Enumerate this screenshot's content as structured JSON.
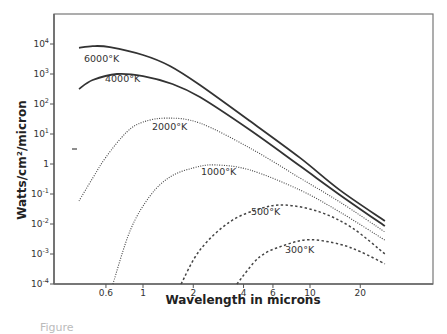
{
  "chart_data": {
    "type": "line",
    "title": "",
    "xlabel": "Wavelength in microns",
    "ylabel": "Watts/cm²/micron",
    "xscale": "log",
    "yscale": "log",
    "xlim": [
      0.3,
      60
    ],
    "ylim": [
      0.0001,
      100000
    ],
    "grid": false,
    "legend": "none (inline curve labels)",
    "x_ticks": [
      {
        "value": 0.6,
        "label": "0.6"
      },
      {
        "value": 1,
        "label": "1"
      },
      {
        "value": 2,
        "label": "2"
      },
      {
        "value": 4,
        "label": "4"
      },
      {
        "value": 6,
        "label": "6"
      },
      {
        "value": 10,
        "label": "10"
      },
      {
        "value": 20,
        "label": "20"
      }
    ],
    "y_ticks": [
      {
        "value": 10000,
        "base": "10",
        "exp": "4"
      },
      {
        "value": 1000,
        "base": "10",
        "exp": "3"
      },
      {
        "value": 100,
        "base": "10",
        "exp": "2"
      },
      {
        "value": 10,
        "base": "10",
        "exp": "1"
      },
      {
        "value": 1,
        "base": "1",
        "exp": ""
      },
      {
        "value": 0.1,
        "base": "10",
        "exp": "-1"
      },
      {
        "value": 0.01,
        "base": "10",
        "exp": "-2"
      },
      {
        "value": 0.001,
        "base": "10",
        "exp": "-3"
      },
      {
        "value": 0.0001,
        "base": "10",
        "exp": "-4"
      }
    ],
    "series": [
      {
        "name": "6000°K",
        "style": "solid",
        "x": [
          0.414,
          0.5,
          0.634,
          1.0,
          1.45,
          2.19,
          4.37,
          8.72,
          15.1,
          28.1
        ],
        "y": [
          7400,
          8500,
          7900,
          4300,
          1850,
          430,
          27,
          1.6,
          0.135,
          0.0126
        ]
      },
      {
        "name": "4000°K",
        "style": "solid",
        "x": [
          0.414,
          0.5,
          0.7,
          1.0,
          1.5,
          2.19,
          4.37,
          8.72,
          15.1,
          28.1
        ],
        "y": [
          316,
          631,
          1000,
          850,
          464,
          170,
          13.5,
          0.85,
          0.093,
          0.0085
        ]
      },
      {
        "name": "2000°K",
        "style": "dotted",
        "x": [
          0.414,
          0.5,
          0.6,
          0.8,
          1.0,
          1.4,
          2.19,
          4.37,
          8.72,
          15.1,
          28.1
        ],
        "y": [
          0.059,
          0.34,
          1.7,
          11.7,
          25,
          34,
          23,
          3.4,
          0.34,
          0.054,
          0.0054
        ]
      },
      {
        "name": "1000°K",
        "style": "dotted",
        "x": [
          0.66,
          0.84,
          1.1,
          1.45,
          2.0,
          2.7,
          4.37,
          8.72,
          15.1,
          28.1
        ],
        "y": [
          0.0001,
          0.0063,
          0.085,
          0.37,
          0.74,
          0.93,
          0.63,
          0.135,
          0.025,
          0.0029
        ]
      },
      {
        "name": "500°K",
        "style": "dashed",
        "x": [
          1.69,
          2.19,
          3.3,
          5.0,
          7.1,
          11.5,
          17.9,
          28.1
        ],
        "y": [
          0.0001,
          0.00135,
          0.0117,
          0.032,
          0.043,
          0.025,
          0.0074,
          0.001
        ]
      },
      {
        "name": "300°K",
        "style": "dashed",
        "x": [
          3.65,
          5.0,
          7.1,
          10,
          15.1,
          20,
          28.1
        ],
        "y": [
          0.0001,
          0.0008,
          0.002,
          0.003,
          0.0021,
          0.0012,
          0.00047
        ]
      }
    ]
  },
  "caption": "Figure"
}
